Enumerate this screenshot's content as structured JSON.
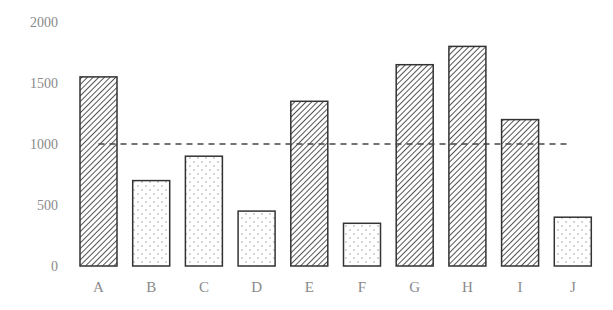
{
  "chart_data": {
    "type": "bar",
    "title": "",
    "xlabel": "",
    "ylabel": "",
    "categories": [
      "A",
      "B",
      "C",
      "D",
      "E",
      "F",
      "G",
      "H",
      "I",
      "J"
    ],
    "values": [
      1550,
      700,
      900,
      450,
      1350,
      350,
      1650,
      1800,
      1200,
      400
    ],
    "bar_style": [
      "hatch",
      "dots",
      "dots",
      "dots",
      "hatch",
      "dots",
      "hatch",
      "hatch",
      "hatch",
      "dots"
    ],
    "threshold_line": {
      "value": 1000,
      "style": "dashed"
    },
    "ylim": [
      0,
      2000
    ],
    "yticks": [
      0,
      500,
      1000,
      1500,
      2000
    ],
    "grid": false,
    "legend": null
  },
  "axis": {
    "y_tick_labels": [
      "0",
      "500",
      "1000",
      "1500",
      "2000"
    ]
  },
  "colors": {
    "bar_outline": "#333333",
    "hatch": "#555555",
    "dots": "#888888",
    "threshold": "#444444",
    "tick_text": "#8a8a8a"
  }
}
